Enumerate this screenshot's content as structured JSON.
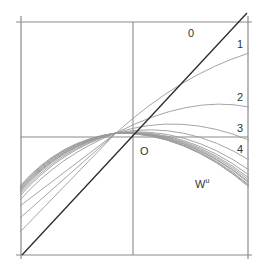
{
  "diagram": {
    "labels": {
      "origin": "O",
      "curve_0": "0",
      "curve_1": "1",
      "curve_2": "2",
      "curve_3": "3",
      "curve_4": "4",
      "manifold": "W",
      "manifold_sup": "u"
    },
    "colors": {
      "frame": "#8a8a8a",
      "diagonal": "#2a2a2a",
      "curves": "#9a9a9a",
      "text": "#333333"
    }
  }
}
